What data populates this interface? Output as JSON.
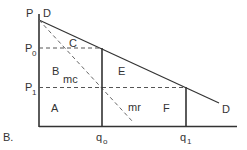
{
  "figure_label": "B.",
  "axis_labels": {
    "price_top": "P",
    "p0": "P",
    "p0_sub": "0",
    "p1": "P",
    "p1_sub": "1",
    "q0": "q",
    "q0_sub": "o",
    "q1": "q",
    "q1_sub": "1"
  },
  "curve_labels": {
    "demand_start": "D",
    "demand_end": "D",
    "marginal_revenue": "mr",
    "marginal_cost": "mc"
  },
  "region_labels": {
    "a": "A",
    "b": "B",
    "c": "C",
    "e": "E",
    "f": "F"
  },
  "colors": {
    "line": "#333333",
    "dashed": "#555555",
    "text": "#333333"
  }
}
